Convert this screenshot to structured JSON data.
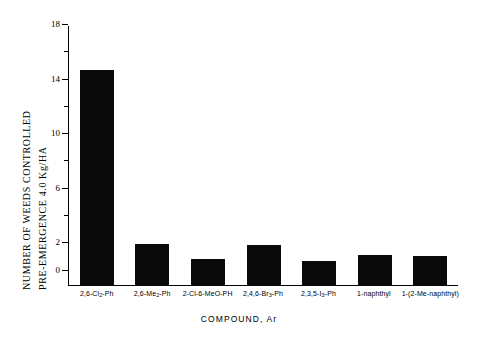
{
  "chart_data": {
    "type": "bar",
    "title": "",
    "subtitle": "",
    "xlabel": "COMPOUND, Ar",
    "ylabel_line1": "NUMBER OF WEEDS CONTROLLED",
    "ylabel_line2": "PRE-EMERGENCE    4.0 Kg/HA",
    "ylabel_top": "NUMBER OF WEEDS CONTROLLED",
    "ylabel_bottom": "PRE-EMERGENCE",
    "ylabel_rate": "4.0 Kg/HA",
    "categories": [
      "2,6-Cl2-Ph",
      "2,6-Me2-Ph",
      "2-Cl-6-MeO-PH",
      "2,4,6-Br3-Ph",
      "2,3,5-I3-Ph",
      "1-naphthyl",
      "1-(2-Me-naphthyl)"
    ],
    "categories_html": [
      "2,6-Cl<sub>2</sub>-Ph",
      "2,6-Me<sub>2</sub>-Ph",
      "2-Cl-6-MeO-PH",
      "2,4,6-Br<sub>3</sub>-Ph",
      "2,3,5-I<sub>3</sub>-Ph",
      "1-naphthyl",
      "1-(2-Me-naphthyl)"
    ],
    "values": [
      14.6,
      1.9,
      0.8,
      1.8,
      0.6,
      1.1,
      1.0
    ],
    "ylim": [
      0,
      18
    ],
    "yticks_major": [
      0,
      2,
      6,
      10,
      14,
      18
    ],
    "yticks_major_labels": [
      "0",
      "2",
      "6",
      "10",
      "14",
      "18"
    ],
    "yticks_minor": [
      4,
      8,
      12,
      16
    ],
    "grid": false,
    "legend": false,
    "legend_position": "none",
    "bar_color": "#0a0a0a",
    "axis_color": "#000000",
    "background_color": "#ffffff",
    "baseline_offset_units": 1.2
  }
}
